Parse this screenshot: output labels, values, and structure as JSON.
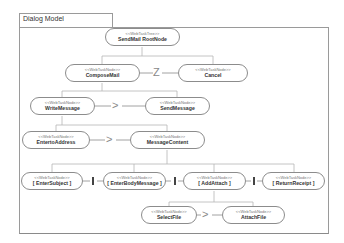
{
  "frame": {
    "title": "Dialog Model"
  },
  "nodes": {
    "root": {
      "stereotype": "<<WebTaskTree>>",
      "name": "SendMail RootNode"
    },
    "compose_mail": {
      "stereotype": "<<WebTaskNode>>",
      "name": "ComposeMail"
    },
    "cancel": {
      "stereotype": "<<WebTaskNode>>",
      "name": "Cancel"
    },
    "write_message": {
      "stereotype": "<<WebTaskNode>>",
      "name": "WriteMessage"
    },
    "send_message": {
      "stereotype": "<<WebTaskNode>>",
      "name": "SendMessage"
    },
    "enter_to_address": {
      "stereotype": "<<WebTaskNode>>",
      "name": "EntertoAddress"
    },
    "message_content": {
      "stereotype": "<<WebTaskNode>>",
      "name": "MessageContent"
    },
    "enter_subject": {
      "stereotype": "<<WebTaskNode>>",
      "name": "[ EnterSubject ]"
    },
    "enter_body_message": {
      "stereotype": "<<WebTaskNode>>",
      "name": "[ EnterBodyMessage ]"
    },
    "add_attach": {
      "stereotype": "<<WebTaskNode>>",
      "name": "[ AddAttach ]"
    },
    "return_receipt": {
      "stereotype": "<<WebTaskNode>>",
      "name": "[ ReturnReceipt ]"
    },
    "select_file": {
      "stereotype": "<<WebTaskNode>>",
      "name": "SelectFile"
    },
    "attach_file": {
      "stereotype": "<<WebTaskNode>>",
      "name": "AttachFile"
    }
  },
  "operators": {
    "compose_cancel": "Z",
    "write_send": ">",
    "address_content": ">",
    "select_attach": ">",
    "concurrent": "|"
  }
}
